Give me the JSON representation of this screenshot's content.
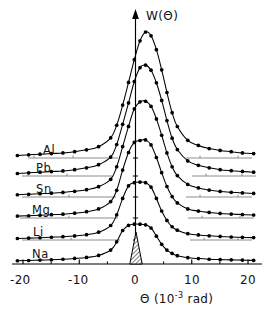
{
  "figure": {
    "background": "#ffffff",
    "ink": "#000000",
    "baseline_color": "#7f7f7f"
  },
  "axes": {
    "y_label": "W(Θ)",
    "x_label_symbol": "Θ",
    "x_label_unit_open": "(10",
    "x_label_unit_exp": "-3",
    "x_label_unit_close": " rad)",
    "x_ticks": [
      "-20",
      "-10",
      "0",
      "10",
      "20"
    ],
    "x_tick_values": [
      -20,
      -10,
      0,
      10,
      20
    ]
  },
  "labels": {
    "al": "Al",
    "pb": "Pb",
    "sn": "Sn",
    "mg": "Mg",
    "li": "Li",
    "na": "Na"
  },
  "annotations": {
    "resolution_peak": "instrument-resolution-peak"
  },
  "chart_data": {
    "type": "line",
    "title": "",
    "subtitle": "",
    "xlabel": "Θ (10-3 rad)",
    "ylabel": "W(Θ)",
    "xlim": [
      -22,
      22
    ],
    "ylim": [
      0,
      1.15
    ],
    "grid": false,
    "legend": "inline-left-labels",
    "note": "Six angular distribution curves, one per metal, each drawn on its own vertically offset baseline. Y values are relative (arbitrary units) above each curve's own baseline. A narrow hatched peak at theta=0 marks the instrumental resolution function.",
    "x": [
      -21,
      -19,
      -17,
      -15,
      -13,
      -11,
      -9,
      -7,
      -5,
      -4,
      -3,
      -2,
      -1,
      0,
      1,
      2,
      3,
      4,
      5,
      6,
      7,
      9,
      11,
      13,
      15,
      17,
      19,
      21
    ],
    "series": [
      {
        "name": "Al",
        "baseline_px": 158,
        "peak_height_rel": 1.0,
        "values": [
          0.02,
          0.025,
          0.03,
          0.035,
          0.04,
          0.05,
          0.065,
          0.09,
          0.16,
          0.26,
          0.42,
          0.6,
          0.78,
          0.93,
          1.0,
          0.97,
          0.86,
          0.7,
          0.52,
          0.36,
          0.25,
          0.14,
          0.1,
          0.075,
          0.06,
          0.05,
          0.04,
          0.035
        ]
      },
      {
        "name": "Pb",
        "baseline_px": 176,
        "peak_height_rel": 0.88,
        "values": [
          0.02,
          0.025,
          0.03,
          0.035,
          0.04,
          0.05,
          0.065,
          0.09,
          0.15,
          0.25,
          0.41,
          0.58,
          0.75,
          0.86,
          0.88,
          0.84,
          0.74,
          0.6,
          0.44,
          0.3,
          0.21,
          0.12,
          0.085,
          0.065,
          0.05,
          0.042,
          0.036,
          0.03
        ]
      },
      {
        "name": "Sn",
        "baseline_px": 197,
        "peak_height_rel": 0.76,
        "values": [
          0.018,
          0.022,
          0.026,
          0.03,
          0.036,
          0.045,
          0.058,
          0.082,
          0.14,
          0.24,
          0.4,
          0.56,
          0.7,
          0.755,
          0.76,
          0.72,
          0.62,
          0.49,
          0.35,
          0.24,
          0.17,
          0.1,
          0.072,
          0.055,
          0.044,
          0.037,
          0.032,
          0.028
        ]
      },
      {
        "name": "Mg",
        "baseline_px": 218,
        "peak_height_rel": 0.62,
        "values": [
          0.015,
          0.018,
          0.022,
          0.026,
          0.03,
          0.038,
          0.05,
          0.072,
          0.13,
          0.22,
          0.38,
          0.52,
          0.6,
          0.615,
          0.62,
          0.58,
          0.48,
          0.36,
          0.25,
          0.17,
          0.12,
          0.072,
          0.055,
          0.044,
          0.036,
          0.031,
          0.027,
          0.024
        ]
      },
      {
        "name": "Li",
        "baseline_px": 240,
        "peak_height_rel": 0.46,
        "values": [
          0.012,
          0.015,
          0.018,
          0.022,
          0.026,
          0.032,
          0.042,
          0.062,
          0.115,
          0.2,
          0.33,
          0.43,
          0.455,
          0.46,
          0.455,
          0.42,
          0.33,
          0.23,
          0.155,
          0.105,
          0.078,
          0.05,
          0.04,
          0.033,
          0.028,
          0.024,
          0.021,
          0.019
        ]
      },
      {
        "name": "Na",
        "baseline_px": 262,
        "peak_height_rel": 0.3,
        "values": [
          0.01,
          0.012,
          0.015,
          0.018,
          0.022,
          0.028,
          0.036,
          0.052,
          0.095,
          0.16,
          0.25,
          0.29,
          0.3,
          0.3,
          0.295,
          0.27,
          0.205,
          0.14,
          0.095,
          0.068,
          0.05,
          0.034,
          0.027,
          0.022,
          0.019,
          0.017,
          0.015,
          0.013
        ]
      }
    ],
    "resolution_peak": {
      "name": "resolution function",
      "hatched": true,
      "theta_half_width": 1.1,
      "baseline_px": 264,
      "top_px": 232
    }
  }
}
